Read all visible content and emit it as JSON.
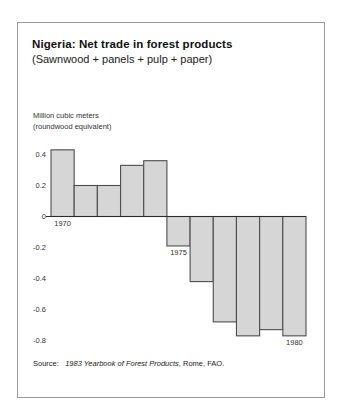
{
  "figure": {
    "title": "Nigeria:  Net trade in forest products",
    "subtitle": "(Sawnwood + panels + pulp + paper)",
    "axis_caption_line1": "Million cubic meters",
    "axis_caption_line2": "(roundwood equivalent)",
    "source_label": "Source:",
    "source_title": "1983 Yearbook of Forest Products",
    "source_tail": ", Rome, FAO.",
    "border_color": "#9a9a9a",
    "bar_fill": "#d6d6d6",
    "bar_stroke": "#4d4d4d",
    "axis_color": "#2b2b2b",
    "background": "#ffffff"
  },
  "chart_data": {
    "type": "bar",
    "title": "Nigeria:  Net trade in forest products",
    "subtitle": "(Sawnwood + panels + pulp + paper)",
    "xlabel": "",
    "ylabel": "Million cubic meters (roundwood equivalent)",
    "ylim": [
      -0.9,
      0.5
    ],
    "grid": false,
    "legend": "none",
    "yticks": [
      0.4,
      0.2,
      0,
      -0.2,
      -0.4,
      -0.6,
      -0.8
    ],
    "ytick_labels": [
      "0.4",
      "0.2",
      "0",
      "-0.2",
      "-0.4",
      "-0.6",
      "-0.8"
    ],
    "categories": [
      1970,
      1971,
      1972,
      1973,
      1974,
      1975,
      1976,
      1977,
      1978,
      1979,
      1980
    ],
    "xtick_labels": [
      "1970",
      "1975",
      "1980"
    ],
    "xtick_positions": [
      1970,
      1975,
      1980
    ],
    "values": [
      0.43,
      0.2,
      0.2,
      0.33,
      0.36,
      -0.19,
      -0.42,
      -0.68,
      -0.77,
      -0.73,
      -0.77
    ],
    "units": "million cubic meters (roundwood equivalent)"
  }
}
